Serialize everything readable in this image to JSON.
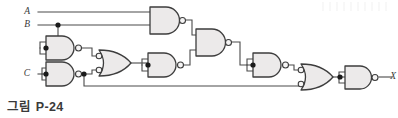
{
  "figure": {
    "caption": "그림 P-24",
    "output_label": "X"
  },
  "colors": {
    "wire": "#4a4a4a",
    "gate_outline": "#3d3d3d",
    "gate_fill": "#eceaea",
    "gate_fill_dark": "#d9d7d7",
    "label": "#3a3a3a",
    "junction": "#1a1a1a",
    "background": "#ffffff"
  },
  "inputs": [
    {
      "id": "A",
      "label": "A",
      "x": 30,
      "y": 12
    },
    {
      "id": "B",
      "label": "B",
      "x": 30,
      "y": 25
    },
    {
      "id": "C",
      "label": "C",
      "x": 30,
      "y": 73
    }
  ],
  "outputs": [
    {
      "id": "X",
      "label": "X",
      "x": 383,
      "y": 78
    }
  ],
  "gates": [
    {
      "id": "g1",
      "type": "nand",
      "label": "NAND 1",
      "x": 150,
      "y": 7,
      "w": 32,
      "h": 27,
      "inputs": [
        "A",
        "B"
      ]
    },
    {
      "id": "g2",
      "type": "nand",
      "label": "NAND 2",
      "x": 46,
      "y": 36,
      "w": 32,
      "h": 24,
      "inputs": [
        "B",
        "B"
      ]
    },
    {
      "id": "g3",
      "type": "nand",
      "label": "NAND 3",
      "x": 46,
      "y": 62,
      "w": 32,
      "h": 24,
      "inputs": [
        "C",
        "C"
      ]
    },
    {
      "id": "g4",
      "type": "or-neg-in",
      "label": "OR with inverted inputs",
      "x": 98,
      "y": 50,
      "w": 32,
      "h": 26,
      "inputs": [
        "g2",
        "g3"
      ]
    },
    {
      "id": "g5",
      "type": "nand",
      "label": "NAND 4",
      "x": 148,
      "y": 53,
      "w": 32,
      "h": 24,
      "inputs": [
        "g4",
        "g4"
      ]
    },
    {
      "id": "g6",
      "type": "nand",
      "label": "NAND 5",
      "x": 196,
      "y": 29,
      "w": 32,
      "h": 27,
      "inputs": [
        "g1",
        "g5"
      ]
    },
    {
      "id": "g7",
      "type": "nand",
      "label": "NAND 6",
      "x": 253,
      "y": 53,
      "w": 32,
      "h": 24,
      "inputs": [
        "g6",
        "g6"
      ]
    },
    {
      "id": "g8",
      "type": "or-neg-in",
      "label": "OR with inverted inputs",
      "x": 300,
      "y": 64,
      "w": 32,
      "h": 26,
      "inputs": [
        "g7",
        "g3"
      ]
    },
    {
      "id": "g9",
      "type": "nand",
      "label": "NAND 7",
      "x": 345,
      "y": 66,
      "w": 30,
      "h": 23,
      "inputs": [
        "g8",
        "g8"
      ]
    }
  ],
  "junctions": [
    {
      "id": "j-b",
      "x": 58,
      "y": 25
    },
    {
      "id": "j-g2-in",
      "x": 46,
      "y": 48
    },
    {
      "id": "j-c-in",
      "x": 46,
      "y": 74
    },
    {
      "id": "j-g3-out",
      "x": 84,
      "y": 74
    },
    {
      "id": "j-g5-in",
      "x": 148,
      "y": 65
    },
    {
      "id": "j-g7-in",
      "x": 253,
      "y": 65
    },
    {
      "id": "j-g9-in",
      "x": 340,
      "y": 77
    }
  ]
}
